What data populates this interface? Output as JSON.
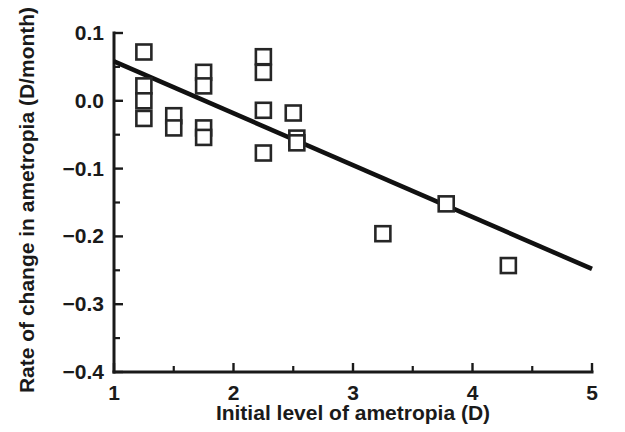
{
  "chart_data": {
    "type": "scatter",
    "title": "",
    "xlabel": "Initial level of ametropia (D)",
    "ylabel": "Rate of change in ametropia (D/month)",
    "xlim": [
      1,
      5
    ],
    "ylim": [
      -0.4,
      0.1
    ],
    "grid": false,
    "legend": "none",
    "x_ticks": [
      1,
      2,
      3,
      4,
      5
    ],
    "x_tick_labels": [
      "1",
      "2",
      "3",
      "4",
      "5"
    ],
    "x_minor_ticks": [
      1.5,
      2.5,
      3.5,
      4.5
    ],
    "y_ticks": [
      0.1,
      0.0,
      -0.1,
      -0.2,
      -0.3,
      -0.4
    ],
    "y_tick_labels": [
      "0.1",
      "0.0",
      "−0.1",
      "−0.2",
      "−0.3",
      "−0.4"
    ],
    "y_minor_ticks": [
      0.05,
      -0.05,
      -0.15,
      -0.25,
      -0.35
    ],
    "marker_style": "open-square",
    "marker_color": "#262626",
    "marker_fill": "#ffffff",
    "line_color": "#111111",
    "points": [
      {
        "x": 1.25,
        "y": 0.072
      },
      {
        "x": 1.25,
        "y": 0.022
      },
      {
        "x": 1.25,
        "y": 0.0
      },
      {
        "x": 1.25,
        "y": -0.026
      },
      {
        "x": 1.5,
        "y": -0.022
      },
      {
        "x": 1.5,
        "y": -0.04
      },
      {
        "x": 1.75,
        "y": 0.042
      },
      {
        "x": 1.75,
        "y": 0.022
      },
      {
        "x": 1.75,
        "y": -0.04
      },
      {
        "x": 1.75,
        "y": -0.054
      },
      {
        "x": 2.25,
        "y": 0.065
      },
      {
        "x": 2.25,
        "y": 0.042
      },
      {
        "x": 2.25,
        "y": -0.014
      },
      {
        "x": 2.25,
        "y": -0.077
      },
      {
        "x": 2.5,
        "y": -0.018
      },
      {
        "x": 2.53,
        "y": -0.055
      },
      {
        "x": 2.53,
        "y": -0.062
      },
      {
        "x": 3.25,
        "y": -0.196
      },
      {
        "x": 3.78,
        "y": -0.152
      },
      {
        "x": 4.3,
        "y": -0.243
      }
    ],
    "fit_line": {
      "label": "regression line",
      "x_start": 1.0,
      "y_start": 0.058,
      "x_end": 5.0,
      "y_end": -0.248
    }
  }
}
